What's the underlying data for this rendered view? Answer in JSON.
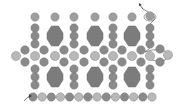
{
  "diagram": {
    "type": "beadwork-pattern",
    "background": "#ffffff",
    "colors": {
      "bead_dark": "#8a8a8a",
      "bead_mid": "#9e9e9e",
      "bead_light": "#b8b8b8",
      "bead_stroke": "#7a7a7a",
      "large_bead": "#7c7c7c",
      "large_bead_stroke": "#6a6a6a",
      "thread": "#444444"
    },
    "top_beads": [
      {
        "x": 35,
        "y": 17
      },
      {
        "x": 55,
        "y": 17
      },
      {
        "x": 74,
        "y": 17
      },
      {
        "x": 95,
        "y": 17
      },
      {
        "x": 113,
        "y": 17
      },
      {
        "x": 132,
        "y": 17
      },
      {
        "x": 150,
        "y": 16
      }
    ],
    "bead_columns_x": [
      35,
      74,
      113,
      150
    ],
    "column_beads_y": [
      28,
      36,
      44
    ],
    "large_beads_upper": [
      {
        "x": 55,
        "y": 36
      },
      {
        "x": 95,
        "y": 36
      },
      {
        "x": 132,
        "y": 36
      }
    ],
    "net_row_top": [
      {
        "x": 25,
        "y": 50,
        "shade": "dark"
      },
      {
        "x": 44,
        "y": 50,
        "shade": "dark"
      },
      {
        "x": 64,
        "y": 50,
        "shade": "dark"
      },
      {
        "x": 84,
        "y": 50,
        "shade": "dark"
      },
      {
        "x": 104,
        "y": 50,
        "shade": "dark"
      },
      {
        "x": 122,
        "y": 50,
        "shade": "dark"
      },
      {
        "x": 141,
        "y": 50,
        "shade": "dark"
      },
      {
        "x": 160,
        "y": 49,
        "shade": "dark"
      }
    ],
    "net_row_mid": [
      {
        "x": 16,
        "y": 56,
        "shade": "light"
      },
      {
        "x": 35,
        "y": 56,
        "shade": "light"
      },
      {
        "x": 55,
        "y": 56,
        "shade": "light"
      },
      {
        "x": 74,
        "y": 56,
        "shade": "light"
      },
      {
        "x": 95,
        "y": 56,
        "shade": "light"
      },
      {
        "x": 113,
        "y": 56,
        "shade": "light"
      },
      {
        "x": 132,
        "y": 56,
        "shade": "light"
      },
      {
        "x": 150,
        "y": 56,
        "shade": "light"
      },
      {
        "x": 168,
        "y": 55,
        "shade": "light"
      }
    ],
    "net_row_bottom": [
      {
        "x": 25,
        "y": 62,
        "shade": "dark"
      },
      {
        "x": 44,
        "y": 62,
        "shade": "dark"
      },
      {
        "x": 64,
        "y": 62,
        "shade": "dark"
      },
      {
        "x": 84,
        "y": 62,
        "shade": "dark"
      },
      {
        "x": 104,
        "y": 62,
        "shade": "dark"
      },
      {
        "x": 122,
        "y": 62,
        "shade": "dark"
      },
      {
        "x": 141,
        "y": 62,
        "shade": "dark"
      },
      {
        "x": 160,
        "y": 62,
        "shade": "dark"
      }
    ],
    "lower_column_beads_y": [
      69,
      77,
      85
    ],
    "large_beads_lower": [
      {
        "x": 55,
        "y": 77
      },
      {
        "x": 95,
        "y": 77
      },
      {
        "x": 132,
        "y": 77
      }
    ],
    "bottom_row": {
      "y": 97,
      "x_start": 33,
      "x_end": 152,
      "count": 14
    },
    "thread_start": {
      "label": "start-arrow",
      "x": 25,
      "y": 101
    },
    "thread_end": {
      "label": "end-arrow",
      "x": 140,
      "y": 6
    }
  }
}
